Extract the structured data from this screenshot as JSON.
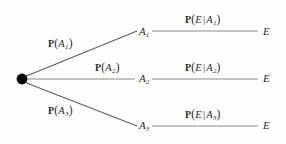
{
  "diagram": {
    "type": "probability-tree",
    "canvas": {
      "width": 286,
      "height": 144,
      "background": "#fefefe"
    },
    "colors": {
      "line": "#6e6e6e",
      "diagonal_line": "#5a5a5a",
      "text": "#2b2b2b",
      "root_node": "#000000"
    },
    "root": {
      "name": "root-node",
      "shape": "filled-circle",
      "x": 22,
      "y": 79,
      "radius": 5
    },
    "branches": [
      {
        "id": "branch-1",
        "prior_label": {
          "fn": "P",
          "open": "(",
          "var": "A",
          "sub": "1",
          "close": ")"
        },
        "prior_text": "P (A1)",
        "node": {
          "var": "A",
          "sub": "1",
          "x": 140,
          "y": 32
        },
        "conditional_label": {
          "fn": "P",
          "open": "(",
          "event": "E",
          "bar": "|",
          "var": "A",
          "sub": "1",
          "close": ")"
        },
        "conditional_text": "P (E | A1)",
        "outcome": {
          "var": "E",
          "x": 265,
          "y": 32
        }
      },
      {
        "id": "branch-2",
        "prior_label": {
          "fn": "P",
          "open": "(",
          "var": "A",
          "sub": "2",
          "close": ")"
        },
        "prior_text": "P (A2)",
        "node": {
          "var": "A",
          "sub": "2",
          "x": 140,
          "y": 79
        },
        "conditional_label": {
          "fn": "P",
          "open": "(",
          "event": "E",
          "bar": "|",
          "var": "A",
          "sub": "2",
          "close": ")"
        },
        "conditional_text": "P (E | A2)",
        "outcome": {
          "var": "E",
          "x": 265,
          "y": 79
        }
      },
      {
        "id": "branch-3",
        "prior_label": {
          "fn": "P",
          "open": "(",
          "var": "A",
          "sub": "3",
          "close": ")"
        },
        "prior_text": "P (A3)",
        "node": {
          "var": "A",
          "sub": "3",
          "x": 140,
          "y": 126
        },
        "conditional_label": {
          "fn": "P",
          "open": "(",
          "event": "E",
          "bar": "|",
          "var": "A",
          "sub": "3",
          "close": ")"
        },
        "conditional_text": "P (E | A3)",
        "outcome": {
          "var": "E",
          "x": 265,
          "y": 126
        }
      }
    ],
    "glyphs": {
      "P": "P",
      "open_paren": "(",
      "close_paren": ")",
      "pipe": "|",
      "A": "A",
      "E": "E",
      "one": "1",
      "two": "2",
      "three": "3"
    }
  }
}
